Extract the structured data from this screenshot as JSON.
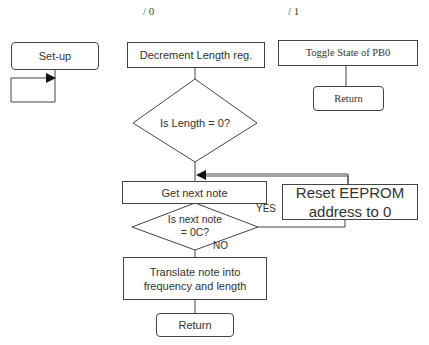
{
  "markers": {
    "left": "/ 0",
    "right": "/ 1"
  },
  "setup": {
    "label": "Set-up"
  },
  "main_flow": {
    "decrement": "Decrement Length reg.",
    "length_check": "Is Length = 0?",
    "get_next_note": "Get next note",
    "note_check_line1": "Is next note",
    "note_check_line2": "= 0C?",
    "yes_label": "YES",
    "no_label": "NO",
    "translate_line1": "Translate note into",
    "translate_line2": "frequency and length",
    "return": "Return"
  },
  "reset": {
    "line1": "Reset EEPROM",
    "line2": "address to 0"
  },
  "toggle_flow": {
    "toggle": "Toggle State of PB0",
    "return": "Return"
  }
}
